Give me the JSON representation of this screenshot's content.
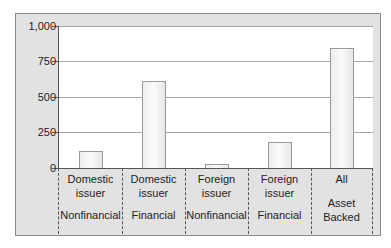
{
  "chart_data": {
    "type": "bar",
    "title": "",
    "xlabel": "",
    "ylabel": "",
    "ylim": [
      0,
      1000
    ],
    "yticks": [
      0,
      250,
      500,
      750,
      1000
    ],
    "ytick_labels": [
      "0",
      "250",
      "500",
      "750",
      "1,000"
    ],
    "grid": true,
    "legend": null,
    "categories": [
      {
        "line1": "Domestic",
        "line2": "issuer",
        "sub": "Nonfinancial"
      },
      {
        "line1": "Domestic",
        "line2": "issuer",
        "sub": "Financial"
      },
      {
        "line1": "Foreign",
        "line2": "issuer",
        "sub": "Nonfinancial"
      },
      {
        "line1": "Foreign",
        "line2": "issuer",
        "sub": "Financial"
      },
      {
        "line1": "All",
        "line2": "",
        "sub": "Asset Backed"
      }
    ],
    "category_labels": [
      "Domestic issuer Nonfinancial",
      "Domestic issuer Financial",
      "Foreign issuer Nonfinancial",
      "Foreign issuer Financial",
      "All Asset Backed"
    ],
    "values": [
      120,
      610,
      25,
      185,
      845
    ]
  },
  "labels": {
    "cat5_sub1": "Asset",
    "cat5_sub2": "Backed"
  }
}
